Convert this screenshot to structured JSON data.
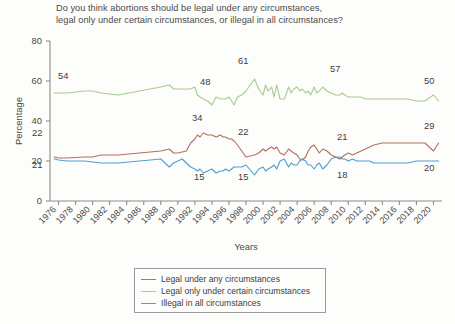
{
  "chart_data": {
    "type": "line",
    "title": "Do you think abortions should be legal under any circumstances, legal only under certain circumstances, or illegal in all circumstances?",
    "title_line1": "Do you think abortions should be legal under any circumstances,",
    "title_line2": "legal only under certain circumstances, or illegal in all circumstances?",
    "xlabel": "Years",
    "ylabel": "Percentage",
    "ylim": [
      0,
      80
    ],
    "xlim": [
      1975,
      2021
    ],
    "yticks": [
      0,
      20,
      40,
      60,
      80
    ],
    "xticks": [
      "1976",
      "1978",
      "1980",
      "1982",
      "1984",
      "1986",
      "1988",
      "1990",
      "1992",
      "1994",
      "1996",
      "1998",
      "2000",
      "2002",
      "2004",
      "2006",
      "2008",
      "2010",
      "2012",
      "2014",
      "2016",
      "2018",
      "2020"
    ],
    "grid": false,
    "legend_position": "bottom-center",
    "x": [
      1975.5,
      1976,
      1977,
      1979,
      1980,
      1981,
      1983,
      1988,
      1989,
      1989.5,
      1990,
      1990.5,
      1991,
      1991.5,
      1992,
      1992.3,
      1992.6,
      1993,
      1993.5,
      1994,
      1994.5,
      1995,
      1995.3,
      1995.6,
      1996,
      1996.3,
      1996.6,
      1997,
      1997.5,
      1998,
      1999,
      1999.5,
      2000,
      2000.3,
      2000.6,
      2001,
      2001.3,
      2001.6,
      2002,
      2002.5,
      2003,
      2003.3,
      2003.6,
      2004,
      2004.3,
      2004.6,
      2005,
      2005.3,
      2005.6,
      2006,
      2006.3,
      2006.6,
      2007,
      2007.5,
      2008,
      2008.5,
      2009,
      2009.3,
      2009.6,
      2010,
      2010.5,
      2011,
      2011.5,
      2012,
      2012.5,
      2013,
      2013.5,
      2014,
      2015,
      2016,
      2017,
      2018,
      2019,
      2020,
      2020.6
    ],
    "series": [
      {
        "name": "Legal under any circumstances",
        "color": "#b5705f",
        "values": [
          22,
          21.5,
          21.5,
          22,
          22,
          23,
          23,
          25,
          26,
          24,
          24,
          24.5,
          25,
          29,
          31,
          33,
          32,
          34,
          33,
          33,
          32,
          33,
          32,
          32,
          31,
          31,
          30,
          28,
          25,
          22,
          23,
          24,
          26,
          25,
          26,
          27,
          26,
          27,
          24,
          23,
          26,
          25,
          24,
          23,
          21,
          20.5,
          22,
          25,
          27,
          28,
          26,
          24,
          26,
          25,
          23,
          22,
          21,
          22,
          23,
          24,
          23,
          24,
          25,
          26,
          27,
          28,
          28.5,
          29,
          29,
          29,
          29,
          29,
          29,
          25,
          29
        ]
      },
      {
        "name": "Legal only under certain circumstances",
        "color": "#a8cd8d",
        "values": [
          54,
          54,
          54,
          55,
          55,
          54,
          53,
          57,
          58,
          56,
          56,
          56,
          56,
          56,
          57,
          53,
          52,
          51,
          50,
          48,
          52,
          51,
          51,
          51,
          52,
          50,
          48,
          52,
          53,
          55,
          61,
          56,
          53,
          58,
          55,
          57,
          52,
          58,
          51,
          51,
          57,
          54,
          56,
          57,
          55,
          56,
          54,
          55,
          53,
          57,
          54,
          55,
          57,
          55,
          54,
          53,
          53,
          54,
          53,
          52,
          52,
          52,
          52,
          51,
          51,
          51,
          51,
          51,
          51,
          51,
          51,
          50,
          50,
          53,
          50
        ]
      },
      {
        "name": "Illegal in all circumstances",
        "color": "#4f9fd4",
        "values": [
          21,
          20.5,
          20,
          20,
          19.5,
          19,
          19,
          21,
          17,
          19,
          20,
          21,
          19,
          17,
          16,
          15,
          16,
          14,
          15,
          16,
          14,
          15,
          15,
          16,
          15,
          16,
          17,
          17,
          17,
          18,
          13,
          16,
          17,
          15,
          16,
          17,
          18,
          16,
          20,
          21,
          17,
          19,
          18,
          18,
          20,
          21,
          20,
          18,
          18,
          16,
          18,
          19,
          16,
          18,
          21,
          22,
          22,
          21,
          21,
          20,
          21,
          20,
          20,
          20,
          20,
          19,
          19,
          19,
          19,
          19,
          19,
          20,
          20,
          20,
          20
        ]
      }
    ],
    "annotations": [
      {
        "text": "54",
        "series": "Legal only under certain circumstances",
        "x": 1976,
        "y": 54,
        "px": 58,
        "py": 79
      },
      {
        "text": "48",
        "series": "Legal only under certain circumstances",
        "x": 1994,
        "y": 48,
        "px": 200,
        "py": 85
      },
      {
        "text": "61",
        "series": "Legal only under certain circumstances",
        "x": 1999,
        "y": 61,
        "px": 238,
        "py": 64
      },
      {
        "text": "57",
        "series": "Legal only under certain circumstances",
        "x": 2007,
        "y": 57,
        "px": 330,
        "py": 72
      },
      {
        "text": "50",
        "series": "Legal only under certain circumstances",
        "x": 2020,
        "y": 50,
        "px": 424,
        "py": 84
      },
      {
        "text": "22",
        "series": "Legal under any circumstances",
        "x": 1976,
        "y": 22,
        "px": 32,
        "py": 136
      },
      {
        "text": "34",
        "series": "Legal under any circumstances",
        "x": 1993,
        "y": 34,
        "px": 192,
        "py": 121
      },
      {
        "text": "22",
        "series": "Legal under any circumstances",
        "x": 1998,
        "y": 22,
        "px": 238,
        "py": 135
      },
      {
        "text": "21",
        "series": "Legal under any circumstances",
        "x": 2008,
        "y": 21,
        "px": 337,
        "py": 140
      },
      {
        "text": "29",
        "series": "Legal under any circumstances",
        "x": 2020,
        "y": 29,
        "px": 424,
        "py": 129
      },
      {
        "text": "21",
        "series": "Illegal in all circumstances",
        "x": 1976,
        "y": 21,
        "px": 32,
        "py": 168
      },
      {
        "text": "15",
        "series": "Illegal in all circumstances",
        "x": 1992,
        "y": 15,
        "px": 194,
        "py": 180
      },
      {
        "text": "15",
        "series": "Illegal in all circumstances",
        "x": 1997,
        "y": 15,
        "px": 238,
        "py": 180
      },
      {
        "text": "18",
        "series": "Illegal in all circumstances",
        "x": 2008,
        "y": 18,
        "px": 337,
        "py": 178
      },
      {
        "text": "20",
        "series": "Illegal in all circumstances",
        "x": 2020,
        "y": 20,
        "px": 424,
        "py": 171
      }
    ]
  },
  "legend": {
    "items": [
      {
        "label": "Legal under any circumstances",
        "color": "#b5705f"
      },
      {
        "label": "Legal only under certain circumstances",
        "color": "#a8cd8d"
      },
      {
        "label": "Illegal in all circumstances",
        "color": "#4f9fd4"
      }
    ]
  },
  "axes": {
    "y_title": "Percentage",
    "x_title": "Years"
  }
}
